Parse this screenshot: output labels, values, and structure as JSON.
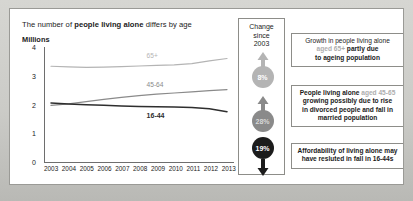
{
  "title": {
    "prefix": "The number of ",
    "emphasis": "people living alone",
    "suffix": " differs by age"
  },
  "axis_unit_label": "Millions",
  "chart_data": {
    "type": "line",
    "title": "The number of people living alone differs by age",
    "xlabel": "",
    "ylabel": "Millions",
    "ylim": [
      0,
      4
    ],
    "yticks": [
      0,
      1,
      2,
      3,
      4
    ],
    "grid": false,
    "legend": "inline-labels",
    "x": [
      2003,
      2004,
      2005,
      2006,
      2007,
      2008,
      2009,
      2010,
      2011,
      2012,
      2013
    ],
    "series": [
      {
        "name": "65+",
        "color": "#b4b4b4",
        "values": [
          3.33,
          3.31,
          3.29,
          3.3,
          3.32,
          3.34,
          3.36,
          3.38,
          3.42,
          3.52,
          3.6
        ]
      },
      {
        "name": "45-64",
        "color": "#8a8a8a",
        "values": [
          1.97,
          2.02,
          2.1,
          2.18,
          2.25,
          2.31,
          2.36,
          2.4,
          2.44,
          2.48,
          2.52
        ]
      },
      {
        "name": "16-44",
        "color": "#2e2e2e",
        "values": [
          2.05,
          2.02,
          1.99,
          1.97,
          1.95,
          1.93,
          1.92,
          1.91,
          1.9,
          1.85,
          1.75
        ]
      }
    ],
    "xtick_labels": [
      "2003",
      "2004",
      "2005",
      "2006",
      "2007",
      "2008",
      "2009",
      "2010",
      "2011",
      "2012",
      "2013"
    ]
  },
  "change_column": {
    "heading_line1": "Change",
    "heading_line2": "since",
    "heading_line3": "2003",
    "items": [
      {
        "value": "8%",
        "direction": "up",
        "circle_color": "#b4b4b4",
        "text_color": "#ffffff"
      },
      {
        "value": "28%",
        "direction": "up",
        "circle_color": "#8a8a8a",
        "text_color": "#d8d8d8"
      },
      {
        "value": "19%",
        "direction": "down",
        "circle_color": "#1c1c1c",
        "text_color": "#ffffff"
      }
    ]
  },
  "callouts": [
    {
      "line1": "Growth in people living alone",
      "highlight": "aged 65+",
      "line2_rest": " partly due",
      "line3": "to ageing population"
    },
    {
      "line1": "People living alone",
      "highlight": "aged 45-65",
      "line2": "growing possibly due to rise",
      "line3": "in divorced people and fall in",
      "line4": "married population"
    },
    {
      "line1": "Affordability of living alone may",
      "line2": "have resluted in fall in 16-44s"
    }
  ]
}
